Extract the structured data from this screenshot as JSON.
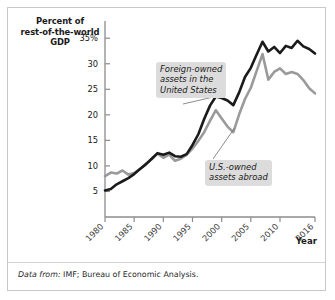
{
  "figure": {
    "axis_title_y": "Percent of\nrest-of-the-world\nGDP",
    "axis_title_x": "Year",
    "source_lead": "Data from:",
    "source_text": " IMF; Bureau of Economic Analysis."
  },
  "callouts": {
    "foreign": "Foreign-owned\nassets in the\nUnited States",
    "us": "U.S.-owned\nassets abroad"
  },
  "chart_data": {
    "type": "line",
    "title": "",
    "xlabel": "Year",
    "ylabel": "Percent of rest-of-the-world GDP",
    "xlim": [
      1980,
      2016
    ],
    "ylim": [
      0,
      37
    ],
    "grid": false,
    "legend_position": "annotations",
    "ytick_values": [
      5,
      10,
      15,
      20,
      25,
      30,
      35
    ],
    "ytick_labels": [
      "5",
      "10",
      "15",
      "20",
      "25",
      "30",
      "35%"
    ],
    "xtick_values": [
      1980,
      1985,
      1990,
      1995,
      2000,
      2005,
      2010,
      2016
    ],
    "xtick_labels": [
      "1980",
      "1985",
      "1990",
      "1995",
      "2000",
      "2005",
      "2010",
      "2016"
    ],
    "x": [
      1980,
      1981,
      1982,
      1983,
      1984,
      1985,
      1986,
      1987,
      1988,
      1989,
      1990,
      1991,
      1992,
      1993,
      1994,
      1995,
      1996,
      1997,
      1998,
      1999,
      2000,
      2001,
      2002,
      2003,
      2004,
      2005,
      2006,
      2007,
      2008,
      2009,
      2010,
      2011,
      2012,
      2013,
      2014,
      2015,
      2016
    ],
    "series": [
      {
        "name": "Foreign-owned assets in the United States",
        "color": "#1a1a1a",
        "values": [
          5.2,
          5.5,
          6.4,
          7.0,
          7.6,
          8.4,
          9.4,
          10.3,
          11.4,
          12.5,
          12.2,
          12.6,
          11.9,
          11.8,
          12.3,
          14.1,
          16.2,
          19.2,
          21.8,
          23.6,
          23.3,
          22.8,
          21.9,
          24.4,
          27.4,
          29.2,
          31.8,
          34.3,
          32.4,
          33.3,
          32.1,
          33.5,
          33.1,
          34.5,
          33.4,
          32.9,
          32.0
        ],
        "style": "thick-black"
      },
      {
        "name": "U.S.-owned assets abroad",
        "color": "#9a9a9a",
        "values": [
          8.0,
          8.7,
          8.5,
          9.1,
          8.3,
          8.6,
          9.4,
          10.4,
          11.3,
          12.4,
          11.6,
          12.2,
          11.0,
          11.4,
          12.2,
          13.4,
          14.9,
          16.6,
          18.8,
          20.9,
          19.3,
          17.7,
          16.6,
          20.1,
          23.1,
          25.3,
          28.6,
          31.9,
          26.9,
          28.4,
          29.1,
          28.0,
          28.4,
          28.0,
          26.8,
          25.2,
          24.2
        ],
        "style": "thick-gray"
      }
    ],
    "annotations": [
      {
        "name": "foreign-owned-callout",
        "text": "Foreign-owned assets in the United States",
        "points_to_year": 1999,
        "points_to_value": 23.6
      },
      {
        "name": "us-owned-callout",
        "text": "U.S.-owned assets abroad",
        "points_to_year": 2002,
        "points_to_value": 16.6
      }
    ]
  }
}
